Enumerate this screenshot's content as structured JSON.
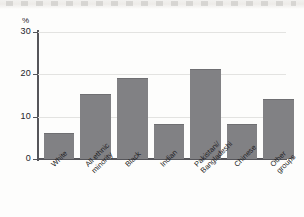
{
  "chart_data": {
    "type": "bar",
    "title": "",
    "xlabel": "",
    "ylabel": "%",
    "unit_label": "%",
    "categories": [
      "White",
      "All ethnic\nminority",
      "Black",
      "Indian",
      "Pakistani/\nBangladeshi",
      "Chinese",
      "Other\ngroups"
    ],
    "values": [
      6,
      15,
      19,
      8,
      21,
      8,
      14
    ],
    "ylim": [
      0,
      30
    ],
    "yticks": [
      0,
      10,
      20,
      30
    ],
    "ytick_labels": [
      "0",
      "10",
      "20",
      "30"
    ],
    "grid": "horizontal",
    "legend": "none",
    "bar_color": "#818184",
    "axis_color": "#55555a",
    "gridline_color": "#e3e3e1",
    "background_color": "#fdfdfc"
  }
}
